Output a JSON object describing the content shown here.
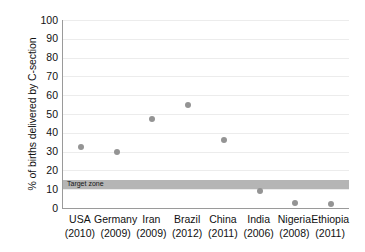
{
  "chart_data": {
    "type": "scatter",
    "title": "",
    "xlabel": "",
    "ylabel": "% of births delivered by C-section",
    "ylim": [
      0,
      100
    ],
    "ytick_labels": [
      "100",
      "90",
      "80",
      "70",
      "60",
      "50",
      "40",
      "30",
      "20",
      "10",
      "0"
    ],
    "yticks": [
      100,
      90,
      80,
      70,
      60,
      50,
      40,
      30,
      20,
      10,
      0
    ],
    "grid": true,
    "legend": "none",
    "categories": [
      "USA",
      "Germany",
      "Iran",
      "Brazil",
      "China",
      "India",
      "Nigeria",
      "Ethiopia"
    ],
    "years": [
      "(2010)",
      "(2009)",
      "(2009)",
      "(2012)",
      "(2011)",
      "(2006)",
      "(2008)",
      "(2011)"
    ],
    "values": [
      32.5,
      30,
      47.5,
      55,
      36,
      9,
      2.5,
      2
    ],
    "points": [
      {
        "country": "USA",
        "year": "(2010)",
        "value": 32.5
      },
      {
        "country": "Germany",
        "year": "(2009)",
        "value": 30
      },
      {
        "country": "Iran",
        "year": "(2009)",
        "value": 47.5
      },
      {
        "country": "Brazil",
        "year": "(2012)",
        "value": 55
      },
      {
        "country": "China",
        "year": "(2011)",
        "value": 36
      },
      {
        "country": "India",
        "year": "(2006)",
        "value": 9
      },
      {
        "country": "Nigeria",
        "year": "(2008)",
        "value": 2.5
      },
      {
        "country": "Ethiopia",
        "year": "(2011)",
        "value": 2
      }
    ],
    "annotations": [
      {
        "name": "target-zone",
        "label": "Target zone",
        "y_from": 10,
        "y_to": 15
      }
    ],
    "colors": {
      "marker": "#949494",
      "target_zone": "#b5b5b5",
      "gridline": "#ececec",
      "axis": "#9a9a9a",
      "text": "#111111",
      "background": "#ffffff"
    }
  }
}
